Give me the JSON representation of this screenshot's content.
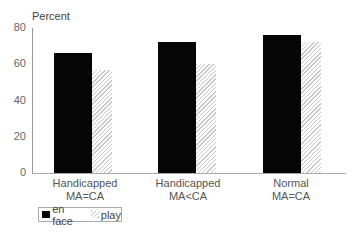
{
  "chart_data": {
    "type": "bar",
    "title": "",
    "ylabel": "Percent",
    "xlabel": "",
    "ylim": [
      0,
      80
    ],
    "yticks": [
      0,
      20,
      40,
      60,
      80
    ],
    "categories": [
      "Handicapped MA=CA",
      "Handicapped MA<CA",
      "Normal MA=CA"
    ],
    "category_lines": [
      [
        "Handicapped",
        "MA=CA"
      ],
      [
        "Handicapped",
        "MA<CA"
      ],
      [
        "Normal",
        "MA=CA"
      ]
    ],
    "series": [
      {
        "name": "en face",
        "color": "#050505",
        "pattern": "solid",
        "values": [
          66,
          72,
          76
        ]
      },
      {
        "name": "play",
        "color": "#c8c8c8",
        "pattern": "diagonal-hatch",
        "values": [
          57,
          60,
          72
        ]
      }
    ],
    "grid": false,
    "legend_position": "bottom-left"
  },
  "axis": {
    "ylabel": "Percent",
    "ticks": [
      "80",
      "60",
      "40",
      "20",
      "0"
    ]
  },
  "categories": [
    {
      "line1": "Handicapped",
      "line2": "MA=CA"
    },
    {
      "line1": "Handicapped",
      "line2": "MA<CA"
    },
    {
      "line1": "Normal",
      "line2": "MA=CA"
    }
  ],
  "legend": {
    "enface": "en face",
    "play": "play"
  }
}
